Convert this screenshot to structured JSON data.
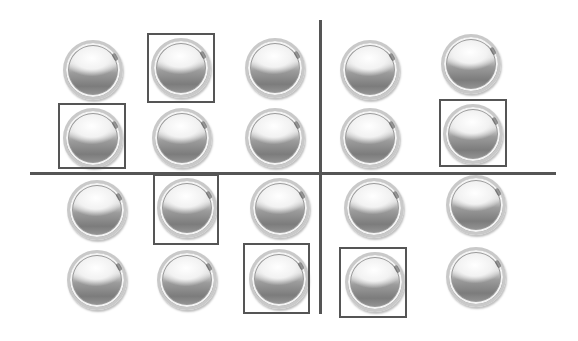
{
  "figure": {
    "grid": {
      "columns": 5,
      "rows": 4
    },
    "colors": {
      "line": "#555555",
      "box": "#555555",
      "background": "#ffffff"
    },
    "dividers": {
      "horizontal": {
        "x1": 30,
        "x2": 556,
        "y": 172
      },
      "vertical": {
        "x": 319,
        "y1": 20,
        "y2": 314
      }
    },
    "balls": [
      {
        "row": 0,
        "col": 0,
        "x": 63,
        "y": 40
      },
      {
        "row": 0,
        "col": 1,
        "x": 151,
        "y": 38
      },
      {
        "row": 0,
        "col": 2,
        "x": 245,
        "y": 38
      },
      {
        "row": 0,
        "col": 3,
        "x": 340,
        "y": 40
      },
      {
        "row": 0,
        "col": 4,
        "x": 441,
        "y": 34
      },
      {
        "row": 1,
        "col": 0,
        "x": 63,
        "y": 108
      },
      {
        "row": 1,
        "col": 1,
        "x": 152,
        "y": 108
      },
      {
        "row": 1,
        "col": 2,
        "x": 245,
        "y": 108
      },
      {
        "row": 1,
        "col": 3,
        "x": 340,
        "y": 108
      },
      {
        "row": 1,
        "col": 4,
        "x": 443,
        "y": 104
      },
      {
        "row": 2,
        "col": 0,
        "x": 67,
        "y": 180
      },
      {
        "row": 2,
        "col": 1,
        "x": 157,
        "y": 178
      },
      {
        "row": 2,
        "col": 2,
        "x": 250,
        "y": 178
      },
      {
        "row": 2,
        "col": 3,
        "x": 344,
        "y": 178
      },
      {
        "row": 2,
        "col": 4,
        "x": 446,
        "y": 175
      },
      {
        "row": 3,
        "col": 0,
        "x": 67,
        "y": 250
      },
      {
        "row": 3,
        "col": 1,
        "x": 157,
        "y": 250
      },
      {
        "row": 3,
        "col": 2,
        "x": 249,
        "y": 249
      },
      {
        "row": 3,
        "col": 3,
        "x": 345,
        "y": 252
      },
      {
        "row": 3,
        "col": 4,
        "x": 446,
        "y": 247
      }
    ],
    "boxes": [
      {
        "row": 0,
        "col": 1,
        "x": 147,
        "y": 33,
        "w": 68,
        "h": 70
      },
      {
        "row": 1,
        "col": 0,
        "x": 58,
        "y": 103,
        "w": 68,
        "h": 66
      },
      {
        "row": 1,
        "col": 4,
        "x": 439,
        "y": 99,
        "w": 68,
        "h": 68
      },
      {
        "row": 2,
        "col": 1,
        "x": 153,
        "y": 174,
        "w": 66,
        "h": 71
      },
      {
        "row": 3,
        "col": 2,
        "x": 243,
        "y": 243,
        "w": 67,
        "h": 71
      },
      {
        "row": 3,
        "col": 3,
        "x": 339,
        "y": 247,
        "w": 68,
        "h": 71
      }
    ]
  }
}
